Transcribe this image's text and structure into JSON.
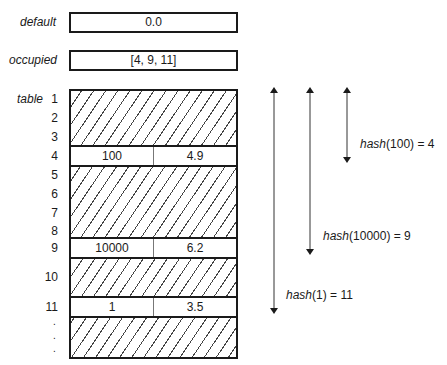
{
  "fields": {
    "default": {
      "label": "default",
      "value": "0.0"
    },
    "occupied": {
      "label": "occupied",
      "value": "[4, 9, 11]"
    }
  },
  "table": {
    "label": "table",
    "row_numbers": [
      "1",
      "2",
      "3",
      "4",
      "5",
      "6",
      "7",
      "8",
      "9",
      "10",
      "11"
    ],
    "ellipsis": [
      ".",
      ".",
      "."
    ],
    "entries": [
      {
        "row": "4",
        "key": "100",
        "value": "4.9"
      },
      {
        "row": "9",
        "key": "10000",
        "value": "6.2"
      },
      {
        "row": "11",
        "key": "1",
        "value": "3.5"
      }
    ]
  },
  "annotations": [
    {
      "fn": "hash",
      "arg": "(100)",
      "eq": " = 4"
    },
    {
      "fn": "hash",
      "arg": "(10000)",
      "eq": " = 9"
    },
    {
      "fn": "hash",
      "arg": "(1)",
      "eq": " = 11"
    }
  ]
}
